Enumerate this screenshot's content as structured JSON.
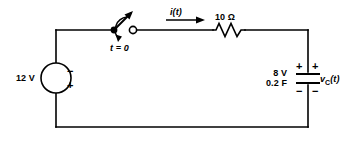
{
  "figure": {
    "background_color": "#ffffff",
    "line_color": "#000000"
  },
  "source": {
    "value": "12 V",
    "polarity_top": "−",
    "polarity_bottom": "+"
  },
  "switch": {
    "label": "t = 0"
  },
  "current": {
    "label": "i(t)"
  },
  "resistor": {
    "label": "10 Ω"
  },
  "capacitor": {
    "initial_voltage": "8 V",
    "capacitance": "0.2 F",
    "voltage_label": "v",
    "voltage_subscript": "C",
    "voltage_arg": "(t)",
    "plus_inner": "+",
    "minus_inner": "−",
    "plus_outer": "+",
    "minus_outer": "−"
  }
}
